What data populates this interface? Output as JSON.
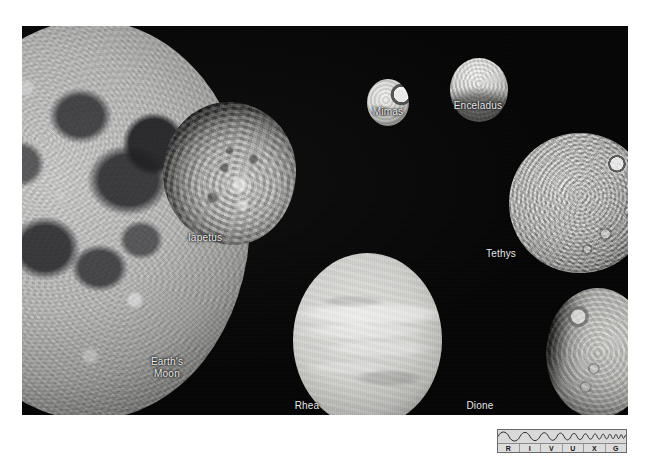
{
  "figure": {
    "kind": "astronomy-photo-plate",
    "background_color": "#ffffff",
    "plate_color": "#050505",
    "label_color": "#e9e9e9",
    "caption_note": "Scale comparison of Earth's Moon with six mid-sized moons of Saturn"
  },
  "moons": [
    {
      "id": "earths-moon",
      "label": "Earth's\nMoon",
      "appearance": "large heavily cratered gray disc, cropped by left edge of frame, dark maria visible"
    },
    {
      "id": "iapetus",
      "label": "Iapetus",
      "appearance": "irregular blotchy disc with bright and dark terrain"
    },
    {
      "id": "mimas",
      "label": "Mimas",
      "appearance": "small bright sphere with large Herschel crater near right limb"
    },
    {
      "id": "enceladus",
      "label": "Enceladus",
      "appearance": "small very bright smooth sphere, darker toward the bottom"
    },
    {
      "id": "tethys",
      "label": "Tethys",
      "appearance": "heavily cratered bright disc with a prominent ringed crater upper right"
    },
    {
      "id": "rhea",
      "label": "Rhea",
      "appearance": "large smooth bright disc with faint bright streaks"
    },
    {
      "id": "dione",
      "label": "Dione",
      "appearance": "gibbous disc lit from the right with craters along the terminator"
    }
  ],
  "rivuxg": {
    "name": "electromagnetic-spectrum-key",
    "letters": [
      "R",
      "I",
      "V",
      "U",
      "X",
      "G"
    ],
    "meaning": "Radio Infrared Visible Ultraviolet X-ray Gamma",
    "highlighted": "V",
    "border_color": "#6a6a6a",
    "fill_color": "#d6d6d6"
  }
}
